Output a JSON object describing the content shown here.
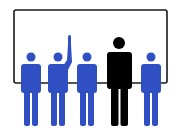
{
  "illustration": {
    "subject": "group of people in front of a board, one raising hand",
    "colors": {
      "background": "#ffffff",
      "board_border": "#1a1a1a",
      "crowd": "#2f4fc2",
      "leader": "#000000"
    },
    "figures": [
      {
        "role": "audience",
        "color": "crowd",
        "hand_raised": false
      },
      {
        "role": "audience",
        "color": "crowd",
        "hand_raised": true
      },
      {
        "role": "audience",
        "color": "crowd",
        "hand_raised": false
      },
      {
        "role": "presenter",
        "color": "leader",
        "hand_raised": false
      },
      {
        "role": "audience",
        "color": "crowd",
        "hand_raised": false
      }
    ]
  }
}
